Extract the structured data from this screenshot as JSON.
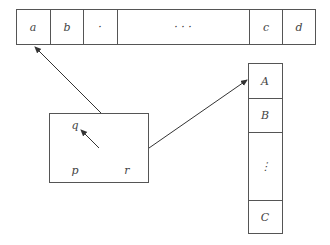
{
  "top_array": {
    "cells": [
      {
        "label": "a",
        "x0": 16,
        "x1": 50
      },
      {
        "label": "b",
        "x0": 50,
        "x1": 83
      },
      {
        "label": "·",
        "x0": 83,
        "x1": 117
      },
      {
        "label": "·  ·  ·",
        "x0": 117,
        "x1": 249
      },
      {
        "label": "c",
        "x0": 249,
        "x1": 282
      },
      {
        "label": "d",
        "x0": 282,
        "x1": 316
      }
    ]
  },
  "node_box": {
    "labels": {
      "q": "q",
      "p": "p",
      "r": "r"
    }
  },
  "right_array": {
    "cells": [
      {
        "label": "A"
      },
      {
        "label": "B"
      },
      {
        "label": "⋮"
      },
      {
        "label": "C"
      }
    ]
  },
  "colors": {
    "stroke": "#555555",
    "text": "#444444",
    "background": "#ffffff"
  }
}
